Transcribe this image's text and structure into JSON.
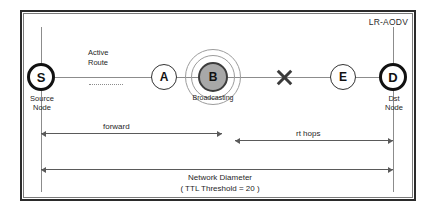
{
  "diagram": {
    "title": "LR-AODV",
    "type": "network-routing-diagram"
  },
  "legend": {
    "active_route_line1": "Active",
    "active_route_line2": "Route"
  },
  "nodes": [
    {
      "id": "S",
      "label": "S",
      "caption_line1": "Source",
      "caption_line2": "Node",
      "style": "thick-ring"
    },
    {
      "id": "A",
      "label": "A",
      "caption_line1": "",
      "caption_line2": "",
      "style": "thin-ring"
    },
    {
      "id": "B",
      "label": "B",
      "caption_line1": "Broadcasting",
      "caption_line2": "",
      "style": "filled-gray-with-broadcast-rings"
    },
    {
      "id": "E",
      "label": "E",
      "caption_line1": "",
      "caption_line2": "",
      "style": "thin-ring"
    },
    {
      "id": "D",
      "label": "D",
      "caption_line1": "Dst",
      "caption_line2": "Node",
      "style": "thick-ring"
    }
  ],
  "link_break": {
    "marker": "X",
    "between": "B-E"
  },
  "measurements": [
    {
      "key": "forward",
      "label": "forward",
      "from": "S",
      "to": "B"
    },
    {
      "key": "rt_hops",
      "label": "rt hops",
      "from": "B",
      "to": "D"
    },
    {
      "key": "network_diameter",
      "label_line1": "Network Diameter",
      "label_line2": "( TTL Threshold = 20 )",
      "from": "S",
      "to": "D"
    }
  ],
  "colors": {
    "frame": "#2b2b2b",
    "line": "#8c8c8c",
    "node_fill_broadcast": "#a8a8a8",
    "arrow": "#5a5a5a"
  }
}
